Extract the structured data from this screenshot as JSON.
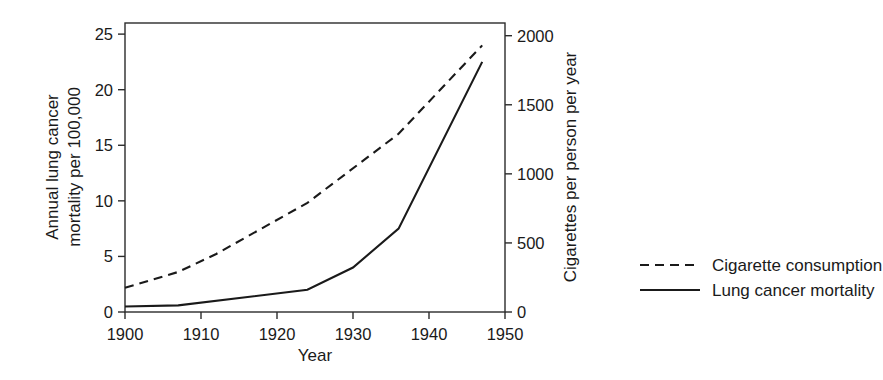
{
  "chart_data": {
    "type": "line",
    "title": "",
    "xlabel": "Year",
    "ylabel": "Annual lung cancer mortality per 100,000",
    "ylabel_line1": "Annual lung cancer",
    "ylabel_line2": "mortality per 100,000",
    "y2label": "Cigarettes per person per year",
    "xlim": [
      1900,
      1950
    ],
    "ylim": [
      0,
      26
    ],
    "y2lim": [
      0,
      2000
    ],
    "grid": false,
    "legend_position": "right",
    "xticks": [
      1900,
      1910,
      1920,
      1930,
      1940,
      1950
    ],
    "xtick_labels": [
      "1900",
      "1910",
      "1920",
      "1930",
      "1940",
      "1950"
    ],
    "yticks": [
      0,
      5,
      10,
      15,
      20,
      25
    ],
    "ytick_labels": [
      "0",
      "5",
      "10",
      "15",
      "20",
      "25"
    ],
    "y2ticks": [
      0,
      500,
      1000,
      1500,
      2000
    ],
    "y2tick_labels": [
      "0",
      "500",
      "1000",
      "1500",
      "2000"
    ],
    "series": [
      {
        "name": "Cigarette consumption",
        "style": "dashed",
        "axis": "right",
        "color": "#1a1a1a",
        "x": [
          1900,
          1907,
          1912,
          1924,
          1936,
          1947
        ],
        "values": [
          175,
          290,
          420,
          790,
          1290,
          1930
        ]
      },
      {
        "name": "Lung cancer mortality",
        "style": "solid",
        "axis": "left",
        "color": "#1a1a1a",
        "x": [
          1900,
          1907,
          1924,
          1930,
          1936,
          1947
        ],
        "values": [
          0.5,
          0.6,
          2.0,
          4.0,
          7.5,
          22.5
        ]
      }
    ]
  },
  "legend": {
    "items": [
      {
        "label": "Cigarette consumption",
        "style": "dashed"
      },
      {
        "label": "Lung cancer mortality",
        "style": "solid"
      }
    ]
  }
}
